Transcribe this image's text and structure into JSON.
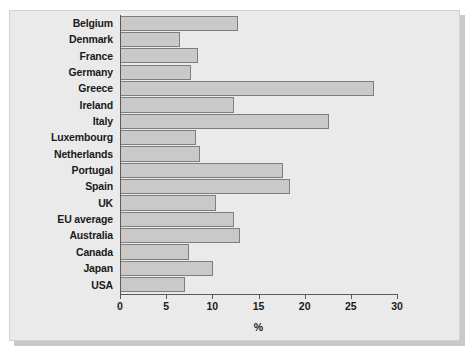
{
  "chart_data": {
    "type": "bar",
    "orientation": "horizontal",
    "title": "",
    "xlabel": "%",
    "ylabel": "",
    "xlim": [
      0,
      30
    ],
    "xticks": [
      0,
      5,
      10,
      15,
      20,
      25,
      30
    ],
    "xtick_labels": [
      "0",
      "5",
      "10",
      "15",
      "20",
      "25",
      "30"
    ],
    "grid": false,
    "legend": null,
    "bar_fill_color": "#c9c9c9",
    "bar_edge_color": "#7e7e7e",
    "panel_color": "#eaeaea",
    "categories": [
      "Belgium",
      "Denmark",
      "France",
      "Germany",
      "Greece",
      "Ireland",
      "Italy",
      "Luxembourg",
      "Netherlands",
      "Portugal",
      "Spain",
      "UK",
      "EU average",
      "Australia",
      "Canada",
      "Japan",
      "USA"
    ],
    "values": [
      12.8,
      6.5,
      8.5,
      7.7,
      27.5,
      12.4,
      22.6,
      8.2,
      8.7,
      17.6,
      18.4,
      10.4,
      12.4,
      13.0,
      7.5,
      10.1,
      7.0
    ]
  }
}
